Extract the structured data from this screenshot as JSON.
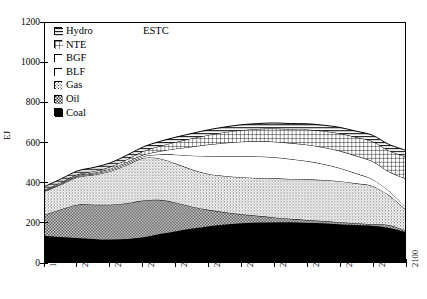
{
  "chart_data": {
    "type": "area",
    "title": "",
    "annotation": "ESTC",
    "xlabel": "",
    "ylabel": "EJ",
    "ylim": [
      0,
      1200
    ],
    "xlim": [
      1990,
      2100
    ],
    "grid": false,
    "legend_position": "top-left",
    "stacked": true,
    "yticks": [
      1200,
      1000,
      800,
      600,
      400,
      200,
      0
    ],
    "xticks": [
      1990,
      2000,
      2010,
      2020,
      2030,
      2040,
      2050,
      2060,
      2070,
      2080,
      2090,
      2100
    ],
    "x": [
      1990,
      1995,
      2000,
      2005,
      2010,
      2015,
      2020,
      2025,
      2030,
      2035,
      2040,
      2045,
      2050,
      2055,
      2060,
      2065,
      2070,
      2075,
      2080,
      2085,
      2090,
      2095,
      2100
    ],
    "series": [
      {
        "name": "Coal",
        "pattern": "solid-black",
        "values": [
          130,
          125,
          120,
          116,
          113,
          115,
          124,
          140,
          155,
          168,
          180,
          188,
          194,
          198,
          200,
          199,
          197,
          194,
          190,
          186,
          182,
          172,
          152
        ]
      },
      {
        "name": "Oil",
        "pattern": "checker-dots",
        "values": [
          108,
          140,
          168,
          172,
          175,
          180,
          185,
          172,
          143,
          110,
          82,
          62,
          46,
          34,
          24,
          18,
          14,
          12,
          10,
          9,
          8,
          14,
          8
        ]
      },
      {
        "name": "Gas",
        "pattern": "fine-stipple",
        "values": [
          118,
          125,
          138,
          150,
          168,
          192,
          213,
          208,
          196,
          186,
          180,
          182,
          186,
          190,
          196,
          200,
          204,
          206,
          206,
          200,
          192,
          150,
          106
        ]
      },
      {
        "name": "BLF",
        "pattern": "white",
        "values": [
          2,
          3,
          4,
          5,
          6,
          7,
          8,
          20,
          45,
          70,
          90,
          100,
          106,
          108,
          106,
          100,
          92,
          80,
          66,
          50,
          34,
          22,
          14
        ]
      },
      {
        "name": "BGF",
        "pattern": "white",
        "values": [
          2,
          3,
          4,
          5,
          6,
          7,
          8,
          16,
          30,
          45,
          58,
          66,
          72,
          76,
          78,
          80,
          82,
          84,
          86,
          88,
          90,
          96,
          140
        ]
      },
      {
        "name": "NTE",
        "pattern": "grid-crosshatch",
        "values": [
          4,
          5,
          6,
          8,
          10,
          14,
          18,
          26,
          34,
          42,
          48,
          54,
          58,
          62,
          66,
          70,
          76,
          82,
          88,
          94,
          100,
          106,
          110
        ]
      },
      {
        "name": "Hydro",
        "pattern": "horizontal-lines",
        "values": [
          16,
          17,
          18,
          19,
          20,
          21,
          22,
          23,
          24,
          25,
          26,
          26,
          27,
          27,
          28,
          28,
          29,
          29,
          30,
          30,
          31,
          31,
          32
        ]
      }
    ],
    "totals": [
      380,
      418,
      458,
      475,
      498,
      536,
      578,
      605,
      627,
      646,
      664,
      678,
      689,
      695,
      698,
      695,
      694,
      687,
      676,
      657,
      637,
      591,
      562
    ]
  },
  "legend": {
    "items": [
      {
        "label": "Hydro",
        "pattern": "horizontal-lines"
      },
      {
        "label": "NTE",
        "pattern": "grid-crosshatch"
      },
      {
        "label": "BGF",
        "pattern": "white"
      },
      {
        "label": "BLF",
        "pattern": "white"
      },
      {
        "label": "Gas",
        "pattern": "fine-stipple"
      },
      {
        "label": "Oil",
        "pattern": "checker-dots"
      },
      {
        "label": "Coal",
        "pattern": "solid-black"
      }
    ]
  },
  "axes": {
    "y_label": "EJ",
    "y_ticks": [
      "1200",
      "1000",
      "800",
      "600",
      "400",
      "200",
      "0"
    ],
    "x_ticks": [
      "1990",
      "2000",
      "2010",
      "2020",
      "2030",
      "2040",
      "2050",
      "2060",
      "2070",
      "2080",
      "2090",
      "2100"
    ]
  },
  "annotation": {
    "text": "ESTC"
  },
  "colors": {
    "ink": "#000000",
    "background": "#ffffff",
    "gas_fill": "#d8d8d8",
    "oil_fill": "#bdbdbd",
    "nte_fill": "#9a9a9a",
    "hydro_fill": "#7a7a7a"
  }
}
